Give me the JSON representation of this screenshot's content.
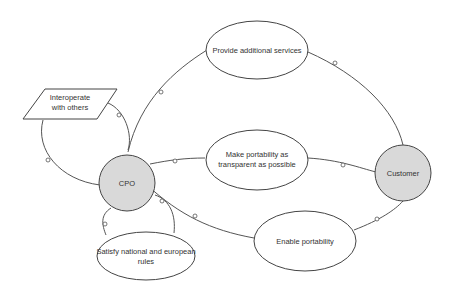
{
  "diagram": {
    "colors": {
      "actor_fill": "#d9d9d9",
      "goal_fill": "#ffffff",
      "stroke": "#444444"
    },
    "actors": [
      {
        "id": "cpo",
        "label": "CPO"
      },
      {
        "id": "customer",
        "label": "Customer"
      }
    ],
    "goals": [
      {
        "id": "services",
        "label": "Provide additional services"
      },
      {
        "id": "transparent",
        "line1": "Make portability as",
        "line2": "transparent as possible"
      },
      {
        "id": "enable",
        "label": "Enable portability"
      },
      {
        "id": "rules",
        "line1": "Satisfy national and european",
        "line2": "rules"
      }
    ],
    "resources": [
      {
        "id": "interop",
        "line1": "Interoperate",
        "line2": "with others"
      }
    ],
    "edges": [
      {
        "from": "cpo",
        "to": "services",
        "via": "services",
        "to2": "customer"
      },
      {
        "from": "cpo",
        "to": "transparent",
        "to2": "customer"
      },
      {
        "from": "cpo",
        "to": "enable",
        "to2": "customer"
      },
      {
        "from": "cpo",
        "to": "rules"
      },
      {
        "from": "cpo",
        "to": "interop"
      }
    ]
  }
}
